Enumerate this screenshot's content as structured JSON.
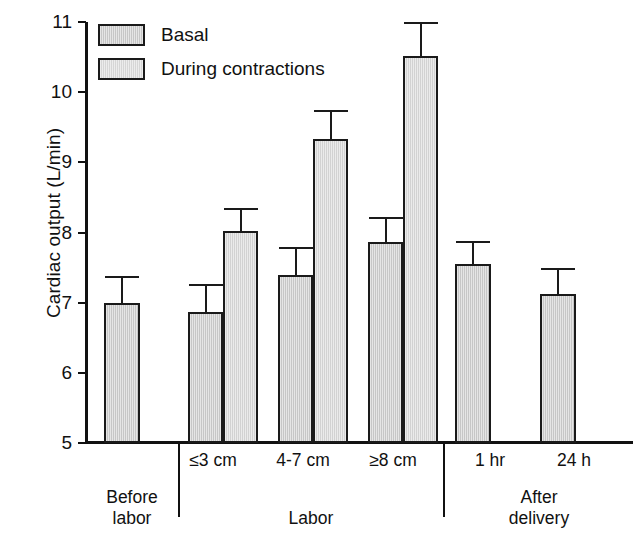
{
  "chart_data": {
    "type": "bar",
    "title": "",
    "xlabel": "",
    "ylabel": "Cardiac output (L/min)",
    "ylim": [
      5,
      11
    ],
    "yticks": [
      5,
      6,
      7,
      8,
      9,
      10,
      11
    ],
    "ytick_labels": [
      "5",
      "6",
      "7",
      "8",
      "9",
      "10",
      "11"
    ],
    "grid": false,
    "legend_position": "top-left",
    "legend": [
      "Basal",
      "During contractions"
    ],
    "categories": [
      "Before labor",
      "≤3 cm",
      "4-7 cm",
      "≥8 cm",
      "1 hr",
      "24 h"
    ],
    "group_labels": [
      "Before labor",
      "Labor",
      "After delivery"
    ],
    "series": [
      {
        "name": "Basal",
        "color": "#c6c6c6",
        "values": [
          7.0,
          6.87,
          7.4,
          7.87,
          7.55,
          7.13
        ],
        "errors": [
          0.38,
          0.4,
          0.4,
          0.35,
          0.33,
          0.37
        ]
      },
      {
        "name": "During contractions",
        "color": "#d2d2d2",
        "values": [
          null,
          8.02,
          9.33,
          10.52,
          null,
          null
        ],
        "errors": [
          null,
          0.33,
          0.42,
          0.48,
          null,
          null
        ]
      }
    ]
  },
  "axis": {
    "y_label": "Cardiac output (L/min)",
    "ticks": [
      {
        "label": "11",
        "value": 11
      },
      {
        "label": "10",
        "value": 10
      },
      {
        "label": "9",
        "value": 9
      },
      {
        "label": "8",
        "value": 8
      },
      {
        "label": "7",
        "value": 7
      },
      {
        "label": "6",
        "value": 6
      },
      {
        "label": "5",
        "value": 5
      }
    ]
  },
  "legend": {
    "items": [
      {
        "label": "Basal"
      },
      {
        "label": "During contractions"
      }
    ]
  },
  "x_axis": {
    "categories": [
      {
        "label": "≤3 cm"
      },
      {
        "label": "4-7 cm"
      },
      {
        "label": "≥8 cm"
      },
      {
        "label": "1 hr"
      },
      {
        "label": "24 h"
      }
    ],
    "groups": [
      {
        "line1": "Before",
        "line2": "labor"
      },
      {
        "line1": "Labor",
        "line2": ""
      },
      {
        "line1": "After",
        "line2": "delivery"
      }
    ]
  },
  "bars": [
    {
      "name": "before-labor-basal",
      "series": "Basal",
      "value": 7.0,
      "error": 0.38,
      "x": 19,
      "w": 36
    },
    {
      "name": "le3cm-basal",
      "series": "Basal",
      "value": 6.87,
      "error": 0.4,
      "x": 103,
      "w": 35
    },
    {
      "name": "le3cm-during",
      "series": "During contractions",
      "value": 8.02,
      "error": 0.33,
      "x": 138,
      "w": 35
    },
    {
      "name": "4-7cm-basal",
      "series": "Basal",
      "value": 7.4,
      "error": 0.4,
      "x": 193,
      "w": 35
    },
    {
      "name": "4-7cm-during",
      "series": "During contractions",
      "value": 9.33,
      "error": 0.42,
      "x": 228,
      "w": 35
    },
    {
      "name": "ge8cm-basal",
      "series": "Basal",
      "value": 7.87,
      "error": 0.35,
      "x": 283,
      "w": 35
    },
    {
      "name": "ge8cm-during",
      "series": "During contractions",
      "value": 10.52,
      "error": 0.48,
      "x": 318,
      "w": 35
    },
    {
      "name": "1hr-basal",
      "series": "Basal",
      "value": 7.55,
      "error": 0.33,
      "x": 370,
      "w": 36
    },
    {
      "name": "24h-basal",
      "series": "Basal",
      "value": 7.13,
      "error": 0.37,
      "x": 455,
      "w": 36
    }
  ]
}
